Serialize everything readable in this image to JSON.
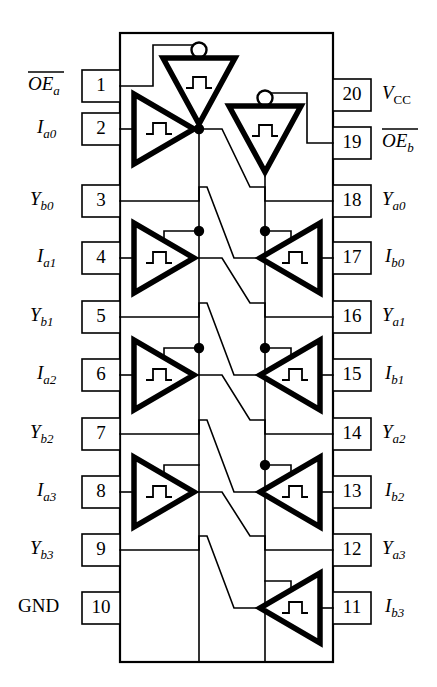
{
  "diagram": {
    "type": "ic-pinout-schematic",
    "title": "",
    "package": "20-pin DIP",
    "width": 437,
    "height": 687,
    "colors": {
      "background": "#ffffff",
      "line": "#000000",
      "gate_fill": "#ffffff"
    }
  },
  "pins": {
    "left": [
      {
        "number": "1",
        "label_base": "OE",
        "label_sub": "a",
        "overline": true,
        "italic": true,
        "y": 86
      },
      {
        "number": "2",
        "label_base": "I",
        "label_sub": "a0",
        "overline": false,
        "italic": true,
        "y": 129
      },
      {
        "number": "3",
        "label_base": "Y",
        "label_sub": "b0",
        "overline": false,
        "italic": true,
        "y": 201
      },
      {
        "number": "4",
        "label_base": "I",
        "label_sub": "a1",
        "overline": false,
        "italic": true,
        "y": 258
      },
      {
        "number": "5",
        "label_base": "Y",
        "label_sub": "b1",
        "overline": false,
        "italic": true,
        "y": 317
      },
      {
        "number": "6",
        "label_base": "I",
        "label_sub": "a2",
        "overline": false,
        "italic": true,
        "y": 375
      },
      {
        "number": "7",
        "label_base": "Y",
        "label_sub": "b2",
        "overline": false,
        "italic": true,
        "y": 434
      },
      {
        "number": "8",
        "label_base": "I",
        "label_sub": "a3",
        "overline": false,
        "italic": true,
        "y": 492
      },
      {
        "number": "9",
        "label_base": "Y",
        "label_sub": "b3",
        "overline": false,
        "italic": true,
        "y": 550
      },
      {
        "number": "10",
        "label_base": "GND",
        "label_sub": "",
        "overline": false,
        "italic": false,
        "y": 608
      }
    ],
    "right": [
      {
        "number": "20",
        "label_base": "V",
        "label_sub": "CC",
        "overline": false,
        "italic": true,
        "sub_upright": true,
        "y": 95
      },
      {
        "number": "19",
        "label_base": "OE",
        "label_sub": "b",
        "overline": true,
        "italic": true,
        "sub_upright": false,
        "y": 143
      },
      {
        "number": "18",
        "label_base": "Y",
        "label_sub": "a0",
        "overline": false,
        "italic": true,
        "sub_upright": false,
        "y": 201
      },
      {
        "number": "17",
        "label_base": "I",
        "label_sub": "b0",
        "overline": false,
        "italic": true,
        "sub_upright": false,
        "y": 258
      },
      {
        "number": "16",
        "label_base": "Y",
        "label_sub": "a1",
        "overline": false,
        "italic": true,
        "sub_upright": false,
        "y": 317
      },
      {
        "number": "15",
        "label_base": "I",
        "label_sub": "b1",
        "overline": false,
        "italic": true,
        "sub_upright": false,
        "y": 375
      },
      {
        "number": "14",
        "label_base": "Y",
        "label_sub": "a2",
        "overline": false,
        "italic": true,
        "sub_upright": false,
        "y": 434
      },
      {
        "number": "13",
        "label_base": "I",
        "label_sub": "b2",
        "overline": false,
        "italic": true,
        "sub_upright": false,
        "y": 492
      },
      {
        "number": "12",
        "label_base": "Y",
        "label_sub": "a3",
        "overline": false,
        "italic": true,
        "sub_upright": false,
        "y": 550
      },
      {
        "number": "11",
        "label_base": "I",
        "label_sub": "b3",
        "overline": false,
        "italic": true,
        "sub_upright": false,
        "y": 608
      }
    ]
  },
  "gates": {
    "inverters": [
      {
        "name": "oe-a-inverter",
        "cx": 199,
        "top": 56,
        "half_width": 36,
        "height": 68
      },
      {
        "name": "oe-b-inverter",
        "cx": 265,
        "top": 104,
        "half_width": 36,
        "height": 68
      }
    ],
    "buffers_left": [
      {
        "name": "buffer-a0",
        "y": 129
      },
      {
        "name": "buffer-a1",
        "y": 258
      },
      {
        "name": "buffer-a2",
        "y": 375
      },
      {
        "name": "buffer-a3",
        "y": 492
      }
    ],
    "buffers_right": [
      {
        "name": "buffer-b0",
        "y": 258
      },
      {
        "name": "buffer-b1",
        "y": 375
      },
      {
        "name": "buffer-b2",
        "y": 492
      },
      {
        "name": "buffer-b3",
        "y": 608
      }
    ],
    "inner_glyph": "schmitt-pulse-step"
  },
  "body": {
    "x": 120,
    "y": 33,
    "width": 213,
    "height": 629
  }
}
